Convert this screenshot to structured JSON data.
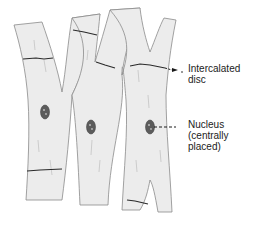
{
  "diagram": {
    "colors": {
      "fiber_fill": "#ececec",
      "outline": "#7a7a7a",
      "disc": "#2a2a2a",
      "nucleus": "#5a5a5a",
      "text": "#222222"
    },
    "labels": [
      {
        "id": "intercalated-disc",
        "line1": "Intercalated",
        "line2": "disc"
      },
      {
        "id": "nucleus",
        "line1": "Nucleus",
        "line2": "(centrally",
        "line3": "placed)"
      }
    ]
  }
}
